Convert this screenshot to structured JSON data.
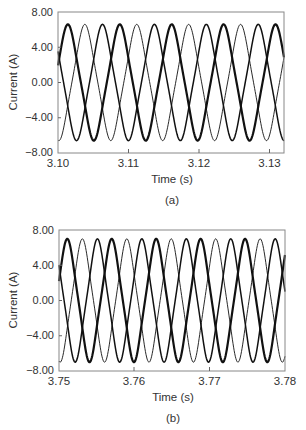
{
  "chart_data": [
    {
      "type": "line",
      "panel_label": "(a)",
      "title": "",
      "xlabel": "Time (s)",
      "ylabel": "Current (A)",
      "xlim": [
        3.1,
        3.132
      ],
      "ylim": [
        -8.0,
        8.0
      ],
      "x_ticks": [
        "3.10",
        "3.11",
        "3.12",
        "3.13"
      ],
      "x_tick_values": [
        3.1,
        3.11,
        3.12,
        3.13
      ],
      "y_ticks": [
        "8.00",
        "4.00",
        "0.00",
        "-4.00",
        "-8.00"
      ],
      "y_tick_values": [
        8,
        4,
        0,
        -4,
        -8
      ],
      "grid": false,
      "legend": null,
      "series": [
        {
          "name": "Phase A",
          "amplitude": 6.6,
          "period_s": 0.00735,
          "first_peak_s": 3.1014,
          "style": "thick"
        },
        {
          "name": "Phase B",
          "amplitude": 6.6,
          "period_s": 0.00735,
          "first_peak_s": 3.1038,
          "style": "thin"
        },
        {
          "name": "Phase C",
          "amplitude": 6.6,
          "period_s": 0.00735,
          "first_peak_s": 3.1063,
          "style": "medium"
        }
      ]
    },
    {
      "type": "line",
      "panel_label": "(b)",
      "title": "",
      "xlabel": "Time (s)",
      "ylabel": "Current (A)",
      "xlim": [
        3.75,
        3.78
      ],
      "ylim": [
        -8.0,
        8.0
      ],
      "x_ticks": [
        "3.75",
        "3.76",
        "3.77",
        "3.78"
      ],
      "x_tick_values": [
        3.75,
        3.76,
        3.77,
        3.78
      ],
      "y_ticks": [
        "8.00",
        "4.00",
        "0.00",
        "-4.00",
        "-8.00"
      ],
      "y_tick_values": [
        8,
        4,
        0,
        -4,
        -8
      ],
      "grid": false,
      "legend": null,
      "series": [
        {
          "name": "Phase A",
          "amplitude": 7.0,
          "period_s": 0.0059,
          "first_peak_s": 3.7511,
          "style": "thick"
        },
        {
          "name": "Phase B",
          "amplitude": 7.0,
          "period_s": 0.0059,
          "first_peak_s": 3.7531,
          "style": "thin"
        },
        {
          "name": "Phase C",
          "amplitude": 7.0,
          "period_s": 0.0059,
          "first_peak_s": 3.7551,
          "style": "medium"
        }
      ]
    }
  ],
  "panels": [
    {
      "label": "(a)",
      "xlabel": "Time (s)",
      "ylabel": "Current (A)",
      "yticks": [
        "8.00",
        "4.00",
        "0.00",
        "−4.00",
        "−8.00"
      ],
      "xticks": [
        "3.10",
        "3.11",
        "3.12",
        "3.13"
      ]
    },
    {
      "label": "(b)",
      "xlabel": "Time (s)",
      "ylabel": "Current (A)",
      "yticks": [
        "8.00",
        "4.00",
        "0.00",
        "−4.00",
        "−8.00"
      ],
      "xticks": [
        "3.75",
        "3.76",
        "3.77",
        "3.78"
      ]
    }
  ]
}
